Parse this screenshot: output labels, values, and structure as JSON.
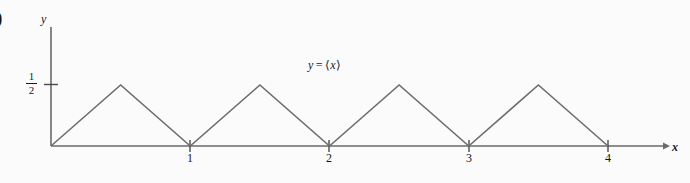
{
  "figure": {
    "enumeration_marker": ")",
    "curve_label": {
      "lhs": "y",
      "operator": "=",
      "rhs_open": "⟨",
      "rhs_var": "x",
      "rhs_close": "⟩"
    },
    "axis_label_x": "x",
    "axis_label_y": "y",
    "y_tick_numerator": "1",
    "y_tick_denominator": "2",
    "colors": {
      "background": "#fbfbfb",
      "axis": "#6a6a6a",
      "curve": "#6d6d6d",
      "text": "#1a1a1a"
    }
  },
  "chart_data": {
    "type": "line",
    "title": "",
    "subtitle": "",
    "xlabel": "x",
    "ylabel": "y",
    "xlim": [
      0,
      4.55
    ],
    "ylim": [
      0,
      0.72
    ],
    "grid": false,
    "legend_position": "none",
    "annotations": [
      "y = ⟨x⟩"
    ],
    "xticks": [
      1,
      2,
      3,
      4
    ],
    "xtick_labels": [
      "1",
      "2",
      "3",
      "4"
    ],
    "yticks": [
      0.5
    ],
    "ytick_labels": [
      "1/2"
    ],
    "series": [
      {
        "name": "y = ⟨x⟩",
        "x": [
          0,
          0.5,
          1,
          1.5,
          2,
          2.5,
          3,
          3.5,
          4
        ],
        "y": [
          0,
          0.5,
          0,
          0.5,
          0,
          0.5,
          0,
          0.5,
          0
        ]
      }
    ]
  }
}
